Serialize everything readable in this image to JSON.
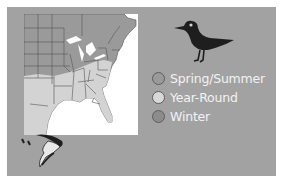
{
  "figure": {
    "background": "#a2a2a2",
    "map_region": "Eastern United States range map",
    "birds": [
      {
        "name": "standing-shorebird",
        "color": "#1e1e1e"
      },
      {
        "name": "flying-shorebird",
        "color": "#1e1e1e"
      }
    ]
  },
  "legend": {
    "items": [
      {
        "label": "Spring/Summer",
        "color": "#9a9a9a"
      },
      {
        "label": "Year-Round",
        "color": "#d8d8d8"
      },
      {
        "label": "Winter",
        "color": "#8c8c8c"
      }
    ]
  },
  "map": {
    "colors": {
      "spring_summer": "#9a9a9a",
      "year_round": "#d3d3d3",
      "winter": "#8c8c8c",
      "ocean": "#ffffff",
      "border": "#555555"
    }
  }
}
